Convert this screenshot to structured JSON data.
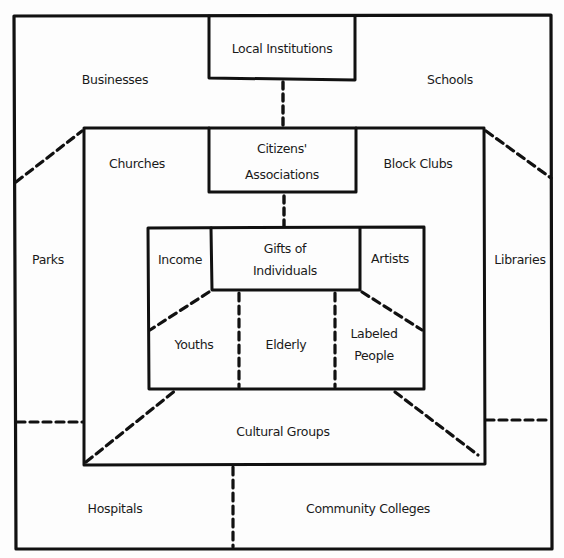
{
  "diagram": {
    "type": "nested-map",
    "colors": {
      "line": "#111111",
      "background": "#fdfdfd",
      "text": "#1a1a1a"
    },
    "outer_ring": {
      "title": "Local Institutions",
      "regions": {
        "businesses": "Businesses",
        "schools": "Schools",
        "parks": "Parks",
        "libraries": "Libraries",
        "hospitals": "Hospitals",
        "community_colleges": "Community Colleges"
      }
    },
    "middle_ring": {
      "title_line1": "Citizens'",
      "title_line2": "Associations",
      "regions": {
        "churches": "Churches",
        "block_clubs": "Block Clubs",
        "cultural_groups": "Cultural Groups"
      }
    },
    "inner_ring": {
      "title_line1": "Gifts of",
      "title_line2": "Individuals",
      "regions": {
        "income": "Income",
        "artists": "Artists",
        "youths": "Youths",
        "elderly": "Elderly",
        "labeled_people_line1": "Labeled",
        "labeled_people_line2": "People"
      }
    }
  }
}
